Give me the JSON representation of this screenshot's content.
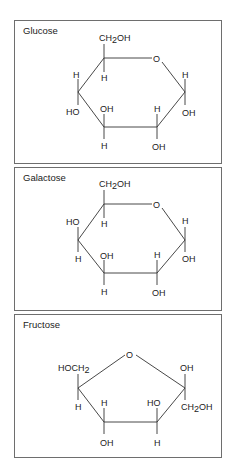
{
  "figure": {
    "panels": [
      {
        "title": "Glucose",
        "ring": "pyranose",
        "substituents": {
          "C6": "CH2OH",
          "ring_oxygen": "O",
          "C5_down": "H",
          "C4_up": "H",
          "C4_down": "HO",
          "C3_up": "OH",
          "C3_down": "H",
          "C2_up": "H",
          "C2_down": "OH",
          "C1_up": "H",
          "C1_down": "OH"
        }
      },
      {
        "title": "Galactose",
        "ring": "pyranose",
        "substituents": {
          "C6": "CH2OH",
          "ring_oxygen": "O",
          "C5_down": "H",
          "C4_up": "HO",
          "C4_down": "H",
          "C3_up": "OH",
          "C3_down": "H",
          "C2_up": "H",
          "C2_down": "OH",
          "C1_up": "H",
          "C1_down": "OH"
        }
      },
      {
        "title": "Fructose",
        "ring": "furanose",
        "substituents": {
          "ring_oxygen": "O",
          "C5_up": "HOCH2",
          "C5_down": "H",
          "C4_up": "H",
          "C4_down": "OH",
          "C3_up": "HO",
          "C3_down": "H",
          "C2_up": "OH",
          "C2_down": "CH2OH"
        }
      }
    ]
  },
  "labels": {
    "O": "O",
    "H": "H",
    "OH": "OH",
    "HO": "HO",
    "CH": "CH",
    "sub2": "2",
    "OH_tail": "OH",
    "HOCH": "HOCH"
  }
}
